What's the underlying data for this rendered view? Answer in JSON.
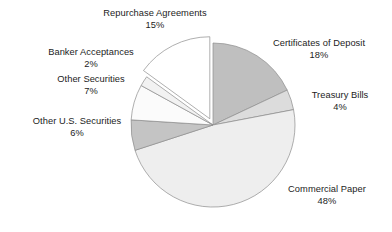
{
  "chart_data": {
    "type": "pie",
    "title": "",
    "subtitle": "",
    "xlabel": "",
    "ylabel": "",
    "grid": false,
    "legend_position": "none",
    "label_format": "name + percent",
    "total_percent": 100,
    "units": "percent",
    "start_angle_deg": 0,
    "direction": "clockwise",
    "categories": [
      "Certificates of Deposit",
      "Treasury Bills",
      "Commercial Paper",
      "Other U.S. Securities",
      "Other Securities",
      "Banker Acceptances",
      "Repurchase Agreements"
    ],
    "values": [
      18,
      4,
      48,
      6,
      7,
      2,
      15
    ],
    "slices": [
      {
        "name": "Certificates of Deposit",
        "value": 18,
        "value_label": "18%",
        "color": "#bfbfbf",
        "exploded": false,
        "start_deg": 0,
        "end_deg": 64.8,
        "label_position": "right-top"
      },
      {
        "name": "Treasury Bills",
        "value": 4,
        "value_label": "4%",
        "color": "#dcdcdc",
        "exploded": false,
        "start_deg": 64.8,
        "end_deg": 79.2,
        "label_position": "right-middle"
      },
      {
        "name": "Commercial Paper",
        "value": 48,
        "value_label": "48%",
        "color": "#eeeeee",
        "exploded": false,
        "start_deg": 79.2,
        "end_deg": 252.0,
        "label_position": "right-bottom"
      },
      {
        "name": "Other U.S. Securities",
        "value": 6,
        "value_label": "6%",
        "color": "#c4c4c4",
        "exploded": false,
        "start_deg": 252.0,
        "end_deg": 273.6,
        "label_position": "left-middle"
      },
      {
        "name": "Other Securities",
        "value": 7,
        "value_label": "7%",
        "color": "#fbfbfb",
        "exploded": false,
        "start_deg": 273.6,
        "end_deg": 298.8,
        "label_position": "left-upper"
      },
      {
        "name": "Banker Acceptances",
        "value": 2,
        "value_label": "2%",
        "color": "#f2f2f2",
        "exploded": false,
        "start_deg": 298.8,
        "end_deg": 306.0,
        "label_position": "left-top"
      },
      {
        "name": "Repurchase Agreements",
        "value": 15,
        "value_label": "15%",
        "color": "#ffffff",
        "exploded": true,
        "start_deg": 306.0,
        "end_deg": 360.0,
        "label_position": "top"
      }
    ],
    "geometry": {
      "center_x": 213,
      "center_y": 125,
      "radius": 82,
      "explode_offset": 7,
      "stroke_color": "#8c8c8c",
      "stroke_width": 0.7,
      "background": "#ffffff"
    }
  },
  "labels": {
    "repurchase": {
      "name": "Repurchase Agreements",
      "value": "15%"
    },
    "banker": {
      "name": "Banker Acceptances",
      "value": "2%"
    },
    "other_securities": {
      "name": "Other Securities",
      "value": "7%"
    },
    "other_us_securities": {
      "name": "Other U.S. Securities",
      "value": "6%"
    },
    "certificates_of_deposit": {
      "name": "Certificates of Deposit",
      "value": "18%"
    },
    "treasury_bills": {
      "name": "Treasury Bills",
      "value": "4%"
    },
    "commercial_paper": {
      "name": "Commercial Paper",
      "value": "48%"
    }
  }
}
